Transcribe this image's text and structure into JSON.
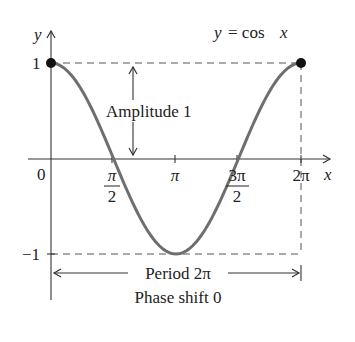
{
  "chart_data": {
    "type": "line",
    "title": "y = cos x",
    "function": "cos x",
    "xlabel": "x",
    "ylabel": "y",
    "x_ticks": [
      {
        "value": 0,
        "label": "0"
      },
      {
        "value": 1.5708,
        "label": "π/2"
      },
      {
        "value": 3.1416,
        "label": "π"
      },
      {
        "value": 4.7124,
        "label": "3π/2"
      },
      {
        "value": 6.2832,
        "label": "2π"
      }
    ],
    "y_ticks": [
      {
        "value": 1,
        "label": "1"
      },
      {
        "value": -1,
        "label": "-1"
      }
    ],
    "xlim": [
      0,
      6.2832
    ],
    "ylim": [
      -1,
      1
    ],
    "series": [
      {
        "name": "y = cos x",
        "color": "#6e6e6e",
        "x": [
          0,
          0.7854,
          1.5708,
          2.3562,
          3.1416,
          3.927,
          4.7124,
          5.4978,
          6.2832
        ],
        "y": [
          1,
          0.7071,
          0,
          -0.7071,
          -1,
          -0.7071,
          0,
          0.7071,
          1
        ]
      }
    ],
    "points": [
      {
        "x": 0,
        "y": 1
      },
      {
        "x": 6.2832,
        "y": 1
      }
    ],
    "annotations": [
      {
        "text": "Amplitude 1",
        "type": "double-arrow-vertical",
        "from_y": 0,
        "to_y": 1
      },
      {
        "text": "Period 2π",
        "type": "double-arrow-horizontal",
        "from_x": 0,
        "to_x": 6.2832
      },
      {
        "text": "Phase shift 0",
        "type": "label"
      }
    ],
    "grid": false,
    "guides": "dashed lines at y=1, y=-1 and x=2π"
  },
  "labels": {
    "title_y": "y",
    "title_eq": "= cos",
    "title_x": "x",
    "axis_x": "x",
    "axis_y": "y",
    "origin": "0",
    "y_one": "1",
    "y_neg_one": "−1",
    "pi_half_num": "π",
    "pi_half_den": "2",
    "pi": "π",
    "three_pi_half_num": "3π",
    "three_pi_half_den": "2",
    "two_pi": "2π",
    "amplitude": "Amplitude 1",
    "period": "Period 2π",
    "phase_shift": "Phase shift 0"
  }
}
